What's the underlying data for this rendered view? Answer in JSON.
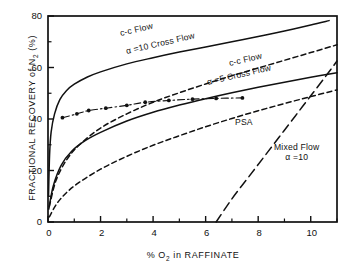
{
  "figure": {
    "background": "#ffffff",
    "ink": "#111111"
  },
  "axes": {
    "ylabel_prefix": "FRACTIONAL  RECOVERY  of  N",
    "ylabel_sub": "2",
    "ylabel_suffix": " (%)",
    "xlabel_prefix": "%  O",
    "xlabel_sub": "2",
    "xlabel_suffix": "  in  RAFFINATE",
    "xticks": [
      0,
      2,
      4,
      6,
      8,
      10
    ],
    "yticks": [
      0,
      20,
      40,
      60,
      80
    ],
    "xminor": [
      1,
      3,
      5,
      7,
      9,
      11
    ],
    "yminor": [
      10,
      30,
      50,
      70
    ],
    "xlim": [
      0,
      11
    ],
    "ylim": [
      0,
      80
    ],
    "grid": false,
    "frame": "box"
  },
  "annotations": [
    {
      "name": "cc-flow-alpha10",
      "line1": "c-c  Flow",
      "line2": "",
      "x": 120,
      "y": 28,
      "rot": -13
    },
    {
      "name": "alpha10-cross-flow",
      "line1": "α =10  Cross  Flow",
      "line2": "",
      "x": 126,
      "y": 46,
      "rot": -13
    },
    {
      "name": "cc-flow-alpha5",
      "line1": "c-c  Flow",
      "line2": "",
      "x": 229,
      "y": 58,
      "rot": -13
    },
    {
      "name": "alpha5-cross-flow",
      "line1": "α =5  Cross  Flow",
      "line2": "",
      "x": 207,
      "y": 77,
      "rot": -13
    },
    {
      "name": "psa-label",
      "line1": "PSA",
      "line2": "",
      "x": 235,
      "y": 117,
      "rot": 0
    },
    {
      "name": "mixed-flow-label",
      "line1": "Mixed  Flow",
      "line2": "α =10",
      "x": 274,
      "y": 142,
      "rot": 0
    }
  ],
  "chart_data": {
    "type": "line",
    "title": "",
    "xlabel": "% O2 in RAFFINATE",
    "ylabel": "FRACTIONAL RECOVERY of N2 (%)",
    "xlim": [
      0,
      11
    ],
    "ylim": [
      0,
      80
    ],
    "xticks": [
      0,
      2,
      4,
      6,
      8,
      10
    ],
    "yticks": [
      0,
      20,
      40,
      60,
      80
    ],
    "grid": false,
    "legend": "inline-annotations",
    "series": [
      {
        "name": "c-c Flow, alpha=10",
        "style": "solid",
        "label": "c-c  Flow",
        "points": [
          [
            0.02,
            10
          ],
          [
            0.06,
            26
          ],
          [
            0.12,
            35
          ],
          [
            0.25,
            42
          ],
          [
            0.45,
            47.5
          ],
          [
            0.7,
            51
          ],
          [
            1.0,
            53.5
          ],
          [
            1.5,
            56.3
          ],
          [
            2.0,
            58.3
          ],
          [
            3.0,
            61.4
          ],
          [
            4.0,
            63.8
          ],
          [
            5.0,
            66.0
          ],
          [
            6.0,
            68.0
          ],
          [
            7.0,
            70.0
          ],
          [
            8.0,
            72.0
          ],
          [
            9.0,
            74.2
          ],
          [
            10.0,
            76.5
          ],
          [
            10.7,
            78.2
          ]
        ]
      },
      {
        "name": "alpha=10 Cross Flow",
        "style": "dashed",
        "label": "α =10  Cross  Flow",
        "points": [
          [
            0.05,
            6
          ],
          [
            0.3,
            16
          ],
          [
            0.7,
            24
          ],
          [
            1.2,
            30
          ],
          [
            2.0,
            36.5
          ],
          [
            3.0,
            42
          ],
          [
            4.0,
            46.5
          ],
          [
            5.0,
            50.2
          ],
          [
            6.0,
            53.6
          ],
          [
            7.0,
            56.8
          ],
          [
            8.0,
            59.8
          ],
          [
            9.0,
            62.8
          ],
          [
            10.0,
            65.8
          ],
          [
            11.0,
            68.8
          ]
        ]
      },
      {
        "name": "c-c Flow, alpha=5",
        "style": "solid",
        "label": "c-c  Flow",
        "points": [
          [
            0.03,
            5
          ],
          [
            0.2,
            14
          ],
          [
            0.5,
            22
          ],
          [
            0.9,
            27.5
          ],
          [
            1.4,
            31.5
          ],
          [
            2.0,
            34.8
          ],
          [
            3.0,
            39.2
          ],
          [
            4.0,
            42.6
          ],
          [
            5.0,
            45.4
          ],
          [
            6.0,
            47.9
          ],
          [
            7.0,
            50.2
          ],
          [
            8.0,
            52.3
          ],
          [
            9.0,
            54.3
          ],
          [
            10.0,
            56.2
          ],
          [
            11.0,
            58.0
          ]
        ]
      },
      {
        "name": "alpha=5 Cross Flow",
        "style": "dashed",
        "label": "α =5  Cross  Flow",
        "points": [
          [
            0.05,
            2
          ],
          [
            0.4,
            8
          ],
          [
            1.0,
            14
          ],
          [
            2.0,
            20.5
          ],
          [
            3.0,
            25.5
          ],
          [
            4.0,
            29.8
          ],
          [
            5.0,
            33.5
          ],
          [
            6.0,
            37.0
          ],
          [
            7.0,
            40.2
          ],
          [
            8.0,
            43.2
          ],
          [
            9.0,
            46.0
          ],
          [
            10.0,
            48.7
          ],
          [
            11.0,
            51.3
          ]
        ]
      },
      {
        "name": "Mixed Flow, alpha=10",
        "style": "long-dashed",
        "label": "Mixed  Flow  α =10",
        "points": [
          [
            6.4,
            0
          ],
          [
            7.0,
            9
          ],
          [
            7.6,
            17
          ],
          [
            8.2,
            25
          ],
          [
            8.8,
            33
          ],
          [
            9.4,
            41
          ],
          [
            10.0,
            49
          ],
          [
            10.6,
            57
          ],
          [
            11.0,
            62.5
          ]
        ]
      },
      {
        "name": "PSA",
        "style": "dash-dot-markers",
        "label": "PSA",
        "marker": "filled-circle",
        "points": [
          [
            0.55,
            40.5
          ],
          [
            1.1,
            42.0
          ],
          [
            1.55,
            43.3
          ],
          [
            2.2,
            44.2
          ],
          [
            3.0,
            45.3
          ],
          [
            3.7,
            46.5
          ],
          [
            4.6,
            47.2
          ],
          [
            5.5,
            47.7
          ],
          [
            6.4,
            48.0
          ],
          [
            7.4,
            48.2
          ]
        ]
      }
    ]
  }
}
